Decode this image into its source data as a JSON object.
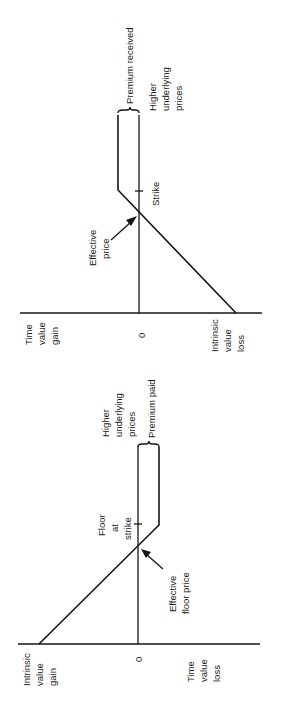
{
  "diagrams": [
    {
      "id": "short-call",
      "axis_labels": {
        "left": [
          "Time",
          "value",
          "gain"
        ],
        "zero": "0",
        "right": [
          "Intrinsic",
          "value",
          "loss"
        ]
      },
      "x_direction_label": [
        "Higher",
        "underlying",
        "prices"
      ],
      "brace_label": "Premium received",
      "strike_label": "Strike",
      "effective_label": [
        "Effective",
        "price"
      ]
    },
    {
      "id": "long-put",
      "axis_labels": {
        "left": [
          "Intrinsic",
          "value",
          "gain"
        ],
        "zero": "0",
        "right": [
          "Time",
          "value",
          "loss"
        ]
      },
      "x_direction_label": [
        "Higher",
        "underlying",
        "prices"
      ],
      "brace_label": "Premium paid",
      "strike_label": [
        "Floor",
        "at",
        "strike"
      ],
      "effective_label": [
        "Effective",
        "floor price"
      ]
    }
  ],
  "colors": {
    "ink": "#151515",
    "background": "#ffffff"
  }
}
